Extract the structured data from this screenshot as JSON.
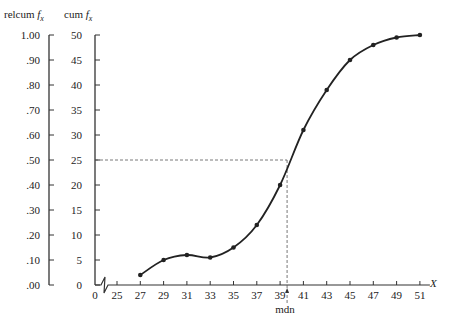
{
  "chart_data": {
    "type": "line",
    "title": "",
    "xlabel": "X",
    "ylabel_left": "relcum f_x",
    "ylabel_right": "cum f_x",
    "x": [
      27,
      29,
      31,
      33,
      35,
      37,
      39,
      41,
      43,
      45,
      47,
      49,
      51
    ],
    "series": [
      {
        "name": "cum f_x",
        "values": [
          2,
          5,
          6,
          5.5,
          7.5,
          12,
          20,
          31,
          39,
          45,
          48,
          49.5,
          50
        ]
      }
    ],
    "x_ticks": [
      "0",
      "25",
      "27",
      "29",
      "31",
      "33",
      "35",
      "37",
      "39",
      "41",
      "43",
      "45",
      "47",
      "49",
      "51"
    ],
    "cum_ticks": [
      "0",
      "5",
      "10",
      "15",
      "20",
      "25",
      "30",
      "35",
      "40",
      "45",
      "50"
    ],
    "relcum_ticks": [
      ".00",
      ".10",
      ".20",
      ".30",
      ".40",
      ".50",
      ".60",
      ".70",
      ".80",
      ".90",
      "1.00"
    ],
    "ylim": [
      0,
      50
    ],
    "xlim": [
      25,
      51
    ],
    "axis_break": true,
    "annotations": [
      {
        "text": "mdn",
        "x": 39.6,
        "note": "median where cum f_x = 25 (relcum .50)"
      }
    ],
    "median_guide": {
      "y_value": 25,
      "x_value": 39.6,
      "style": "dashed"
    },
    "grid": false,
    "legend": "none"
  },
  "labels": {
    "relcum_header": "relcum",
    "cum_header": "cum",
    "f_symbol": "f",
    "f_sub": "x",
    "x_axis": "X",
    "mdn": "mdn"
  }
}
